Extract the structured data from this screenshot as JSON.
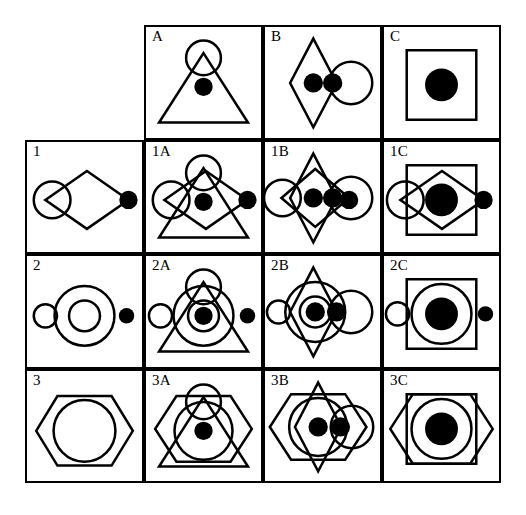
{
  "figure": {
    "background_color": "#ffffff",
    "stroke_color": "#000000",
    "fill_color": "#000000",
    "grid": {
      "rows": 4,
      "columns": 4,
      "cell_width": 119,
      "cell_height": 114.5,
      "border_width": 2
    }
  },
  "labels": {
    "corner": "",
    "columns": [
      "A",
      "B",
      "C"
    ],
    "rows": [
      "1",
      "2",
      "3"
    ],
    "combinations": [
      [
        "1A",
        "1B",
        "1C"
      ],
      [
        "2A",
        "2B",
        "2C"
      ],
      [
        "3A",
        "3B",
        "3C"
      ]
    ]
  },
  "cells": [
    {
      "id": "corner",
      "label": "",
      "bordered": false,
      "parts": []
    },
    {
      "id": "A",
      "label": "A",
      "bordered": true,
      "parts": [
        {
          "shape": "triangle",
          "name": "triangle-outline",
          "filled": false,
          "cx": 59.5,
          "cy": 63,
          "w": 92,
          "h": 72
        },
        {
          "shape": "circle",
          "name": "apex-circle-outline",
          "filled": false,
          "cx": 59.5,
          "cy": 32,
          "r": 18
        },
        {
          "shape": "circle",
          "name": "center-dot-filled",
          "filled": true,
          "cx": 59.5,
          "cy": 62,
          "r": 9.5
        }
      ]
    },
    {
      "id": "B",
      "label": "B",
      "bordered": true,
      "parts": [
        {
          "shape": "diamond",
          "name": "tall-diamond-outline",
          "filled": false,
          "cx": 50,
          "cy": 58,
          "w": 48,
          "h": 92
        },
        {
          "shape": "circle",
          "name": "right-circle-outline",
          "filled": false,
          "cx": 89,
          "cy": 58,
          "r": 22
        },
        {
          "shape": "circle",
          "name": "diamond-center-dot-filled",
          "filled": true,
          "cx": 50,
          "cy": 58,
          "r": 10
        },
        {
          "shape": "circle",
          "name": "right-circle-left-dot-filled",
          "filled": true,
          "cx": 70,
          "cy": 58,
          "r": 10
        }
      ]
    },
    {
      "id": "C",
      "label": "C",
      "bordered": true,
      "parts": [
        {
          "shape": "square",
          "name": "square-outline",
          "filled": false,
          "cx": 59.5,
          "cy": 60,
          "w": 72,
          "h": 72
        },
        {
          "shape": "circle",
          "name": "center-dot-filled",
          "filled": true,
          "cx": 59.5,
          "cy": 60,
          "r": 17
        }
      ]
    },
    {
      "id": "1",
      "label": "1",
      "bordered": true,
      "parts": [
        {
          "shape": "diamond",
          "name": "wide-diamond-outline",
          "filled": false,
          "cx": 62,
          "cy": 60,
          "w": 86,
          "h": 60
        },
        {
          "shape": "circle",
          "name": "left-circle-outline",
          "filled": false,
          "cx": 26,
          "cy": 60,
          "r": 19
        },
        {
          "shape": "circle",
          "name": "right-vertex-dot-filled",
          "filled": true,
          "cx": 105,
          "cy": 60,
          "r": 9.5
        }
      ]
    },
    {
      "id": "1A",
      "label": "1A",
      "bordered": true,
      "parts": [
        {
          "shape": "triangle",
          "name": "triangle-outline",
          "filled": false,
          "cx": 59.5,
          "cy": 63,
          "w": 92,
          "h": 72
        },
        {
          "shape": "circle",
          "name": "apex-circle-outline",
          "filled": false,
          "cx": 59.5,
          "cy": 32,
          "r": 18
        },
        {
          "shape": "diamond",
          "name": "wide-diamond-outline",
          "filled": false,
          "cx": 62,
          "cy": 60,
          "w": 86,
          "h": 60
        },
        {
          "shape": "circle",
          "name": "left-circle-outline",
          "filled": false,
          "cx": 26,
          "cy": 60,
          "r": 19
        },
        {
          "shape": "circle",
          "name": "center-dot-filled",
          "filled": true,
          "cx": 59.5,
          "cy": 62,
          "r": 9.5
        },
        {
          "shape": "circle",
          "name": "right-vertex-dot-filled",
          "filled": true,
          "cx": 105,
          "cy": 60,
          "r": 9.5
        }
      ]
    },
    {
      "id": "1B",
      "label": "1B",
      "bordered": true,
      "parts": [
        {
          "shape": "diamond",
          "name": "tall-diamond-outline",
          "filled": false,
          "cx": 50,
          "cy": 58,
          "w": 48,
          "h": 92
        },
        {
          "shape": "circle",
          "name": "right-circle-outline",
          "filled": false,
          "cx": 89,
          "cy": 58,
          "r": 22
        },
        {
          "shape": "diamond",
          "name": "wide-diamond-outline",
          "filled": false,
          "cx": 52,
          "cy": 58,
          "w": 70,
          "h": 60
        },
        {
          "shape": "circle",
          "name": "left-circle-outline",
          "filled": false,
          "cx": 18,
          "cy": 58,
          "r": 19
        },
        {
          "shape": "circle",
          "name": "diamond-center-dot-filled",
          "filled": true,
          "cx": 50,
          "cy": 58,
          "r": 10
        },
        {
          "shape": "circle",
          "name": "right-circle-left-dot-filled",
          "filled": true,
          "cx": 70,
          "cy": 58,
          "r": 10
        },
        {
          "shape": "circle",
          "name": "right-vertex-dot-filled",
          "filled": true,
          "cx": 87,
          "cy": 60,
          "r": 9.5
        }
      ]
    },
    {
      "id": "1C",
      "label": "1C",
      "bordered": true,
      "parts": [
        {
          "shape": "square",
          "name": "square-outline",
          "filled": false,
          "cx": 59.5,
          "cy": 60,
          "w": 72,
          "h": 72
        },
        {
          "shape": "diamond",
          "name": "wide-diamond-outline",
          "filled": false,
          "cx": 60,
          "cy": 60,
          "w": 86,
          "h": 60
        },
        {
          "shape": "circle",
          "name": "left-circle-outline",
          "filled": false,
          "cx": 22,
          "cy": 60,
          "r": 19
        },
        {
          "shape": "circle",
          "name": "center-dot-filled",
          "filled": true,
          "cx": 59.5,
          "cy": 60,
          "r": 17
        },
        {
          "shape": "circle",
          "name": "right-vertex-dot-filled",
          "filled": true,
          "cx": 103,
          "cy": 60,
          "r": 9.5
        }
      ]
    },
    {
      "id": "2",
      "label": "2",
      "bordered": true,
      "parts": [
        {
          "shape": "circle",
          "name": "small-left-circle-outline",
          "filled": false,
          "cx": 19,
          "cy": 62,
          "r": 12
        },
        {
          "shape": "circle",
          "name": "big-circle-outline",
          "filled": false,
          "cx": 59.5,
          "cy": 62,
          "r": 31
        },
        {
          "shape": "circle",
          "name": "inner-circle-outline",
          "filled": false,
          "cx": 59.5,
          "cy": 62,
          "r": 16
        },
        {
          "shape": "circle",
          "name": "right-dot-filled",
          "filled": true,
          "cx": 103,
          "cy": 62,
          "r": 8
        }
      ]
    },
    {
      "id": "2A",
      "label": "2A",
      "bordered": true,
      "parts": [
        {
          "shape": "triangle",
          "name": "triangle-outline",
          "filled": false,
          "cx": 59.5,
          "cy": 63,
          "w": 92,
          "h": 72
        },
        {
          "shape": "circle",
          "name": "apex-circle-outline",
          "filled": false,
          "cx": 59.5,
          "cy": 32,
          "r": 18
        },
        {
          "shape": "circle",
          "name": "small-left-circle-outline",
          "filled": false,
          "cx": 15,
          "cy": 62,
          "r": 12
        },
        {
          "shape": "circle",
          "name": "big-circle-outline",
          "filled": false,
          "cx": 59.5,
          "cy": 62,
          "r": 31
        },
        {
          "shape": "circle",
          "name": "inner-circle-outline",
          "filled": false,
          "cx": 59.5,
          "cy": 62,
          "r": 16
        },
        {
          "shape": "circle",
          "name": "center-dot-filled",
          "filled": true,
          "cx": 59.5,
          "cy": 62,
          "r": 9.5
        },
        {
          "shape": "circle",
          "name": "right-dot-filled",
          "filled": true,
          "cx": 105,
          "cy": 62,
          "r": 8
        }
      ]
    },
    {
      "id": "2B",
      "label": "2B",
      "bordered": true,
      "parts": [
        {
          "shape": "diamond",
          "name": "tall-diamond-outline",
          "filled": false,
          "cx": 50,
          "cy": 58,
          "w": 48,
          "h": 92
        },
        {
          "shape": "circle",
          "name": "right-circle-outline",
          "filled": false,
          "cx": 89,
          "cy": 58,
          "r": 22
        },
        {
          "shape": "circle",
          "name": "small-left-circle-outline",
          "filled": false,
          "cx": 14,
          "cy": 58,
          "r": 12
        },
        {
          "shape": "circle",
          "name": "big-circle-outline",
          "filled": false,
          "cx": 52,
          "cy": 58,
          "r": 31
        },
        {
          "shape": "circle",
          "name": "inner-circle-outline",
          "filled": false,
          "cx": 52,
          "cy": 58,
          "r": 16
        },
        {
          "shape": "circle",
          "name": "diamond-center-dot-filled",
          "filled": true,
          "cx": 52,
          "cy": 58,
          "r": 10
        },
        {
          "shape": "circle",
          "name": "right-circle-left-dot-filled",
          "filled": true,
          "cx": 74,
          "cy": 58,
          "r": 10
        }
      ]
    },
    {
      "id": "2C",
      "label": "2C",
      "bordered": true,
      "parts": [
        {
          "shape": "square",
          "name": "square-outline",
          "filled": false,
          "cx": 59.5,
          "cy": 60,
          "w": 72,
          "h": 72
        },
        {
          "shape": "circle",
          "name": "small-left-circle-outline",
          "filled": false,
          "cx": 14,
          "cy": 60,
          "r": 12
        },
        {
          "shape": "circle",
          "name": "big-circle-outline",
          "filled": false,
          "cx": 59.5,
          "cy": 60,
          "r": 31
        },
        {
          "shape": "circle",
          "name": "center-dot-filled",
          "filled": true,
          "cx": 59.5,
          "cy": 60,
          "r": 17
        },
        {
          "shape": "circle",
          "name": "right-dot-filled",
          "filled": true,
          "cx": 105,
          "cy": 60,
          "r": 8
        }
      ]
    },
    {
      "id": "3",
      "label": "3",
      "bordered": true,
      "parts": [
        {
          "shape": "hexagon",
          "name": "hexagon-outline",
          "filled": false,
          "cx": 59.5,
          "cy": 62,
          "w": 100,
          "h": 72
        },
        {
          "shape": "circle",
          "name": "inner-circle-outline",
          "filled": false,
          "cx": 59.5,
          "cy": 62,
          "r": 32
        }
      ]
    },
    {
      "id": "3A",
      "label": "3A",
      "bordered": true,
      "parts": [
        {
          "shape": "hexagon",
          "name": "hexagon-outline",
          "filled": false,
          "cx": 59.5,
          "cy": 60,
          "w": 100,
          "h": 68
        },
        {
          "shape": "triangle",
          "name": "triangle-outline",
          "filled": false,
          "cx": 59.5,
          "cy": 63,
          "w": 92,
          "h": 72
        },
        {
          "shape": "circle",
          "name": "apex-circle-outline",
          "filled": false,
          "cx": 59.5,
          "cy": 32,
          "r": 18
        },
        {
          "shape": "circle",
          "name": "inner-circle-outline",
          "filled": false,
          "cx": 59.5,
          "cy": 62,
          "r": 30
        },
        {
          "shape": "circle",
          "name": "center-dot-filled",
          "filled": true,
          "cx": 59.5,
          "cy": 62,
          "r": 9.5
        }
      ]
    },
    {
      "id": "3B",
      "label": "3B",
      "bordered": true,
      "parts": [
        {
          "shape": "hexagon",
          "name": "hexagon-outline",
          "filled": false,
          "cx": 55,
          "cy": 58,
          "w": 100,
          "h": 68
        },
        {
          "shape": "diamond",
          "name": "tall-diamond-outline",
          "filled": false,
          "cx": 55,
          "cy": 58,
          "w": 48,
          "h": 92
        },
        {
          "shape": "circle",
          "name": "right-circle-outline",
          "filled": false,
          "cx": 90,
          "cy": 58,
          "r": 22
        },
        {
          "shape": "circle",
          "name": "inner-circle-outline",
          "filled": false,
          "cx": 55,
          "cy": 58,
          "r": 30
        },
        {
          "shape": "circle",
          "name": "diamond-center-dot-filled",
          "filled": true,
          "cx": 55,
          "cy": 58,
          "r": 10
        },
        {
          "shape": "circle",
          "name": "right-circle-left-dot-filled",
          "filled": true,
          "cx": 78,
          "cy": 58,
          "r": 10
        }
      ]
    },
    {
      "id": "3C",
      "label": "3C",
      "bordered": true,
      "parts": [
        {
          "shape": "hexagon",
          "name": "hexagon-outline",
          "filled": false,
          "cx": 59.5,
          "cy": 60,
          "w": 106,
          "h": 72
        },
        {
          "shape": "square",
          "name": "square-outline",
          "filled": false,
          "cx": 59.5,
          "cy": 60,
          "w": 72,
          "h": 72
        },
        {
          "shape": "circle",
          "name": "inner-circle-outline",
          "filled": false,
          "cx": 59.5,
          "cy": 60,
          "r": 31
        },
        {
          "shape": "circle",
          "name": "center-dot-filled",
          "filled": true,
          "cx": 59.5,
          "cy": 60,
          "r": 17
        }
      ]
    }
  ]
}
